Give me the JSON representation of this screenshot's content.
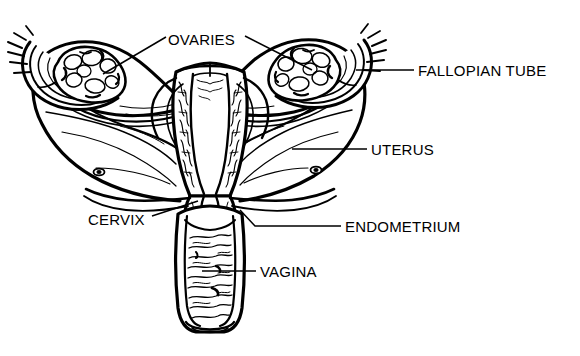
{
  "diagram": {
    "background_color": "#ffffff",
    "ink_color": "#000000",
    "style": "black-and-white line drawing",
    "labels": [
      {
        "id": "ovaries",
        "text": "OVARIES",
        "x": 168,
        "y": 32,
        "leaders": [
          {
            "points": "166,37 103,74"
          },
          {
            "points": "245,36 312,70"
          }
        ]
      },
      {
        "id": "fallopian-tube",
        "text": "FALLOPIAN TUBE",
        "x": 418,
        "y": 63,
        "leaders": [
          {
            "points": "414,70 356,70"
          }
        ]
      },
      {
        "id": "uterus",
        "text": "UTERUS",
        "x": 371,
        "y": 142,
        "leaders": [
          {
            "points": "367,149 292,149"
          }
        ]
      },
      {
        "id": "cervix",
        "text": "CERVIX",
        "x": 88,
        "y": 212,
        "leaders": [
          {
            "points": "152,216 198,201"
          }
        ]
      },
      {
        "id": "endometrium",
        "text": "ENDOMETRIUM",
        "x": 345,
        "y": 219,
        "leaders": [
          {
            "points": "341,226 255,226 240,210"
          }
        ]
      },
      {
        "id": "vagina",
        "text": "VAGINA",
        "x": 260,
        "y": 264,
        "leaders": [
          {
            "points": "256,271 202,271"
          }
        ]
      }
    ],
    "structures": [
      {
        "id": "left-ovary",
        "name": "Left ovary",
        "description": "lumpy oval mass cradled in fimbriated funnel at upper left"
      },
      {
        "id": "right-ovary",
        "name": "Right ovary",
        "description": "lumpy oval mass cradled in fimbriated funnel at upper right"
      },
      {
        "id": "left-fallopian-tube",
        "name": "Left fallopian tube",
        "description": "curved tube arcing from left ovary to uterine fundus"
      },
      {
        "id": "right-fallopian-tube",
        "name": "Right fallopian tube",
        "description": "curved tube arcing from right ovary to uterine fundus"
      },
      {
        "id": "uterus-body",
        "name": "Uterus",
        "description": "central pear-shaped muscular body shown in cutaway"
      },
      {
        "id": "endometrium-lining",
        "name": "Endometrium",
        "description": "textured stippled inner lining of the uterine cavity"
      },
      {
        "id": "cervix-structure",
        "name": "Cervix",
        "description": "narrow neck joining uterus to vagina"
      },
      {
        "id": "vaginal-canal",
        "name": "Vagina",
        "description": "vertical canal below cervix with horizontal rugae"
      },
      {
        "id": "broad-ligament-left",
        "name": "Left broad ligament",
        "description": "large draping membranous wing at lower left"
      },
      {
        "id": "broad-ligament-right",
        "name": "Right broad ligament",
        "description": "large draping membranous wing at lower right"
      }
    ]
  }
}
